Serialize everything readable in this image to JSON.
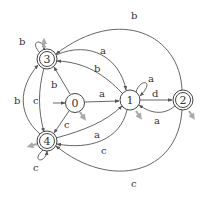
{
  "diagram": {
    "type": "finite-automaton",
    "states": [
      {
        "id": "0",
        "label": "0",
        "start": true,
        "accepting": false
      },
      {
        "id": "1",
        "label": "1",
        "start": false,
        "accepting": false
      },
      {
        "id": "2",
        "label": "2",
        "start": false,
        "accepting": true
      },
      {
        "id": "3",
        "label": "3",
        "start": false,
        "accepting": true
      },
      {
        "id": "4",
        "label": "4",
        "start": false,
        "accepting": true
      }
    ],
    "transitions": [
      {
        "from": "0",
        "to": "1",
        "label": "a"
      },
      {
        "from": "0",
        "to": "3",
        "label": "b"
      },
      {
        "from": "0",
        "to": "4",
        "label": "c"
      },
      {
        "from": "3",
        "to": "3",
        "label": "b"
      },
      {
        "from": "3",
        "to": "1",
        "label": "a"
      },
      {
        "from": "1",
        "to": "3",
        "label": "b"
      },
      {
        "from": "3",
        "to": "4",
        "label": "c"
      },
      {
        "from": "4",
        "to": "3",
        "label": "b"
      },
      {
        "from": "1",
        "to": "1",
        "label": "a"
      },
      {
        "from": "1",
        "to": "2",
        "label": "d"
      },
      {
        "from": "2",
        "to": "1",
        "label": "a"
      },
      {
        "from": "2",
        "to": "3",
        "label": "b"
      },
      {
        "from": "2",
        "to": "4",
        "label": "c"
      },
      {
        "from": "4",
        "to": "1",
        "label": "a"
      },
      {
        "from": "1",
        "to": "4",
        "label": "c"
      },
      {
        "from": "4",
        "to": "4",
        "label": "c"
      }
    ]
  },
  "colors": {
    "edge": "#555555",
    "node_stroke": "#444444",
    "marker_gray": "#aaaaaa",
    "background": "#ffffff"
  }
}
